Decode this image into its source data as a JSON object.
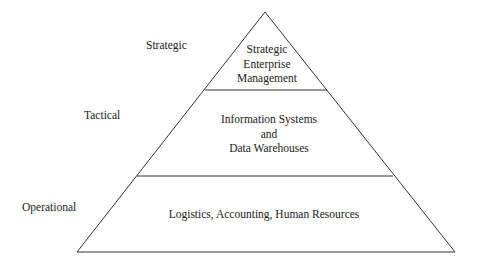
{
  "diagram": {
    "type": "pyramid",
    "line_color": "#333333",
    "levels": [
      {
        "side_label": "Strategic",
        "content_lines": [
          "Strategic",
          "Enterprise",
          "Management"
        ]
      },
      {
        "side_label": "Tactical",
        "content_lines": [
          "Information Systems",
          "and",
          "Data Warehouses"
        ]
      },
      {
        "side_label": "Operational",
        "content_lines": [
          "Logistics, Accounting, Human Resources"
        ]
      }
    ]
  }
}
